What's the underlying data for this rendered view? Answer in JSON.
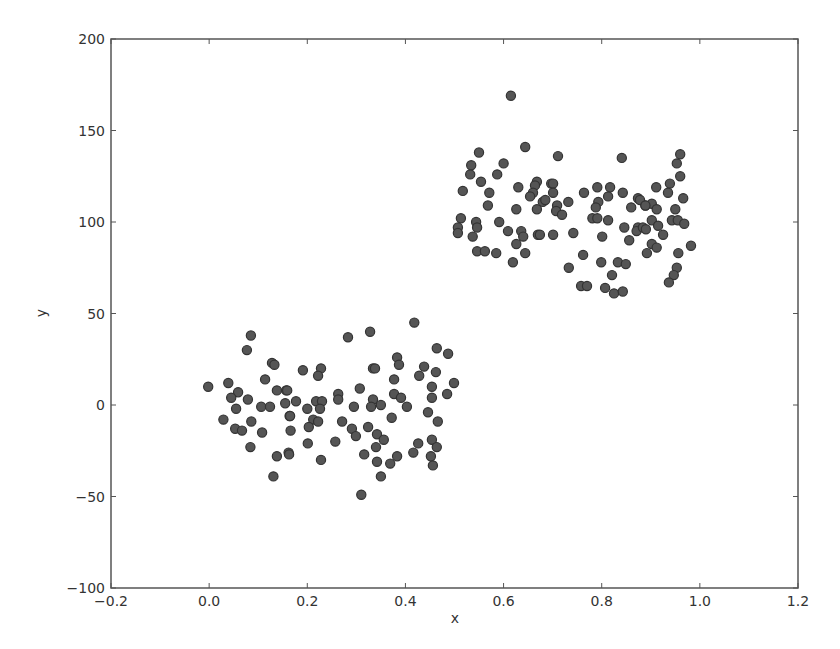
{
  "chart_data": {
    "type": "scatter",
    "title": "",
    "xlabel": "x",
    "ylabel": "y",
    "xlim": [
      -0.2,
      1.2
    ],
    "ylim": [
      -100,
      200
    ],
    "xticks": [
      -0.2,
      0.0,
      0.2,
      0.4,
      0.6,
      0.8,
      1.0,
      1.2
    ],
    "xtick_labels": [
      "−0.2",
      "0.0",
      "0.2",
      "0.4",
      "0.6",
      "0.8",
      "1.0",
      "1.2"
    ],
    "yticks": [
      -100,
      -50,
      0,
      50,
      100,
      150,
      200
    ],
    "ytick_labels": [
      "−100",
      "−50",
      "0",
      "50",
      "100",
      "150",
      "200"
    ],
    "grid": false,
    "legend": null,
    "marker_color": "#555555",
    "marker_edge_color": "#333333",
    "series": [
      {
        "name": "points",
        "x": [
          0.085,
          0.077,
          0.128,
          0.133,
          -0.002,
          0.039,
          0.059,
          0.045,
          0.079,
          0.114,
          0.138,
          0.157,
          0.055,
          0.106,
          0.124,
          0.155,
          0.164,
          0.029,
          0.086,
          0.053,
          0.067,
          0.108,
          0.166,
          0.084,
          0.138,
          0.162,
          0.131,
          0.283,
          0.328,
          0.191,
          0.228,
          0.222,
          0.334,
          0.159,
          0.263,
          0.263,
          0.307,
          0.177,
          0.218,
          0.23,
          0.2,
          0.226,
          0.334,
          0.35,
          0.33,
          0.295,
          0.165,
          0.212,
          0.222,
          0.271,
          0.203,
          0.291,
          0.299,
          0.324,
          0.342,
          0.257,
          0.201,
          0.34,
          0.316,
          0.163,
          0.228,
          0.342,
          0.35,
          0.31,
          0.418,
          0.464,
          0.487,
          0.383,
          0.387,
          0.338,
          0.438,
          0.428,
          0.462,
          0.377,
          0.499,
          0.454,
          0.377,
          0.391,
          0.485,
          0.454,
          0.403,
          0.446,
          0.372,
          0.466,
          0.356,
          0.426,
          0.454,
          0.464,
          0.416,
          0.383,
          0.369,
          0.452,
          0.456,
          0.615,
          0.644,
          0.55,
          0.534,
          0.532,
          0.6,
          0.587,
          0.554,
          0.517,
          0.571,
          0.63,
          0.668,
          0.664,
          0.66,
          0.654,
          0.697,
          0.68,
          0.568,
          0.626,
          0.668,
          0.513,
          0.507,
          0.507,
          0.544,
          0.546,
          0.591,
          0.537,
          0.609,
          0.636,
          0.64,
          0.67,
          0.626,
          0.546,
          0.562,
          0.585,
          0.644,
          0.619,
          0.711,
          0.841,
          0.701,
          0.701,
          0.685,
          0.732,
          0.709,
          0.707,
          0.719,
          0.764,
          0.791,
          0.817,
          0.843,
          0.813,
          0.793,
          0.788,
          0.781,
          0.791,
          0.813,
          0.86,
          0.874,
          0.889,
          0.701,
          0.742,
          0.674,
          0.846,
          0.801,
          0.874,
          0.871,
          0.856,
          0.762,
          0.733,
          0.799,
          0.833,
          0.849,
          0.821,
          0.758,
          0.77,
          0.807,
          0.825,
          0.843,
          0.96,
          0.953,
          0.96,
          0.911,
          0.939,
          0.935,
          0.966,
          0.878,
          0.902,
          0.889,
          0.912,
          0.95,
          0.943,
          0.955,
          0.968,
          0.902,
          0.915,
          0.884,
          0.89,
          0.925,
          0.902,
          0.912,
          0.892,
          0.982,
          0.956,
          0.953,
          0.947,
          0.937
        ],
        "y": [
          38,
          30,
          23,
          22,
          10,
          12,
          7,
          4,
          3,
          14,
          8,
          8,
          -2,
          -1,
          -1,
          1,
          -6,
          -8,
          -9,
          -13,
          -14,
          -15,
          -14,
          -23,
          -28,
          -26,
          -39,
          37,
          40,
          19,
          20,
          16,
          20,
          8,
          6,
          3,
          9,
          2,
          2,
          2,
          -2,
          -2,
          3,
          0,
          -1,
          -1,
          -6,
          -8,
          -9,
          -9,
          -12,
          -13,
          -17,
          -12,
          -16,
          -20,
          -21,
          -23,
          -27,
          -27,
          -30,
          -31,
          -39,
          -49,
          45,
          31,
          28,
          26,
          22,
          20,
          21,
          16,
          18,
          14,
          12,
          10,
          6,
          4,
          6,
          4,
          -1,
          -4,
          -7,
          -9,
          -19,
          -21,
          -19,
          -23,
          -26,
          -28,
          -32,
          -28,
          -33,
          169,
          141,
          138,
          131,
          126,
          132,
          126,
          122,
          117,
          116,
          119,
          122,
          120,
          116,
          114,
          121,
          111,
          109,
          107,
          107,
          102,
          97,
          94,
          100,
          97,
          100,
          92,
          95,
          95,
          92,
          93,
          88,
          84,
          84,
          83,
          83,
          78,
          136,
          135,
          121,
          116,
          112,
          111,
          109,
          106,
          104,
          116,
          119,
          119,
          116,
          114,
          111,
          108,
          102,
          102,
          101,
          108,
          113,
          109,
          93,
          94,
          93,
          97,
          92,
          97,
          95,
          90,
          82,
          75,
          78,
          78,
          77,
          71,
          65,
          65,
          64,
          61,
          62,
          137,
          132,
          125,
          119,
          121,
          116,
          113,
          112,
          110,
          109,
          107,
          107,
          101,
          101,
          99,
          101,
          98,
          97,
          96,
          93,
          88,
          86,
          83,
          87,
          83,
          75,
          71,
          67
        ]
      }
    ]
  }
}
